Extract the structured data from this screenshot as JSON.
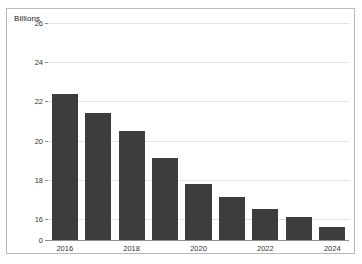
{
  "chart_data": {
    "type": "bar",
    "title": "",
    "subtitle": "",
    "xlabel": "",
    "ylabel": "Billions",
    "categories": [
      "2016",
      "2017",
      "2018",
      "2019",
      "2020",
      "2021",
      "2022",
      "2023",
      "2024"
    ],
    "values": [
      22.4,
      21.4,
      20.5,
      19.1,
      17.8,
      17.1,
      16.5,
      16.1,
      15.6
    ],
    "x_tick_labels": [
      "2016",
      "2018",
      "2020",
      "2022",
      "2024"
    ],
    "y_tick_labels": [
      "0",
      "16",
      "18",
      "20",
      "22",
      "24",
      "26"
    ],
    "ylim": [
      16,
      26
    ],
    "y_axis_note": "broken axis: baseline labeled 0, value scale starts at 16",
    "grid": true,
    "legend": false,
    "bar_color": "#3d3d3d",
    "grid_color": "#e3e3e3",
    "axis_color": "#8e8e8e",
    "border_color": "#b9b9b9",
    "background": "#ffffff"
  },
  "panel": {
    "axis_title": "Billions"
  }
}
